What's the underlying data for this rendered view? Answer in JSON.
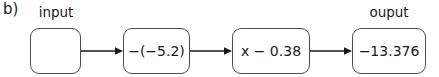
{
  "figure": {
    "panel_label": "b)",
    "background_color": "#ffffff",
    "stroke_color": "#4d4d4d",
    "text_color": "#1a1a1a"
  },
  "labels": {
    "input": "input",
    "output": "ouput"
  },
  "nodes": [
    {
      "name": "input-box",
      "text": "",
      "label": "input"
    },
    {
      "name": "operation-box-1",
      "text": "−(−5.2)",
      "label": ""
    },
    {
      "name": "operation-box-2",
      "text": "x − 0.38",
      "label": ""
    },
    {
      "name": "output-box",
      "text": "−13.376",
      "label": "ouput"
    }
  ],
  "arrows": [
    {
      "name": "arrow-1",
      "from": "input-box",
      "to": "operation-box-1"
    },
    {
      "name": "arrow-2",
      "from": "operation-box-1",
      "to": "operation-box-2"
    },
    {
      "name": "arrow-3",
      "from": "operation-box-2",
      "to": "output-box"
    }
  ]
}
